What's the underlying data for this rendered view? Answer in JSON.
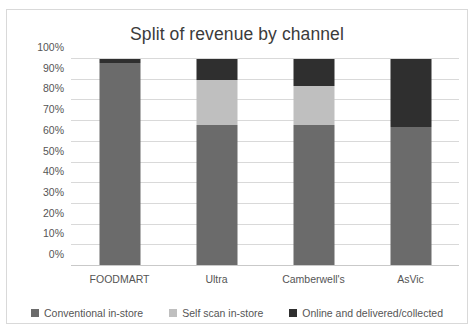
{
  "chart_data": {
    "type": "bar",
    "subtype": "stacked-100-percent",
    "title": "Split of revenue by channel",
    "xlabel": "",
    "ylabel": "",
    "categories": [
      "FOODMART",
      "Ultra",
      "Camberwell's",
      "AsVic"
    ],
    "series": [
      {
        "name": "Conventional in-store",
        "color": "#6b6b6b",
        "values": [
          98,
          68,
          68,
          67
        ]
      },
      {
        "name": "Self scan in-store",
        "color": "#bfbfbf",
        "values": [
          0,
          22,
          19,
          0
        ]
      },
      {
        "name": "Online and delivered/collected",
        "color": "#2f2f2f",
        "values": [
          2,
          10,
          13,
          33
        ]
      }
    ],
    "ylim": [
      0,
      100
    ],
    "yticks": [
      "0%",
      "10%",
      "20%",
      "30%",
      "40%",
      "50%",
      "60%",
      "70%",
      "80%",
      "90%",
      "100%"
    ],
    "ytick_values": [
      0,
      10,
      20,
      30,
      40,
      50,
      60,
      70,
      80,
      90,
      100
    ],
    "grid": true,
    "legend_position": "bottom",
    "gridline_color": "#d9d9d9",
    "axis_color": "#c9c9c9",
    "text_color": "#555555",
    "title_color": "#3b3b3b",
    "plot_background": "#ffffff",
    "frame_border_color": "#d9d9d9"
  }
}
